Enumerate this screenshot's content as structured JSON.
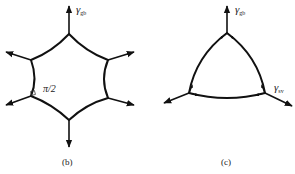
{
  "figures": [
    {
      "id": "b",
      "caption": "(b)",
      "shape": "hexagon-grain-concave-sides",
      "labels": {
        "tension_symbol": "γ",
        "tension_subscript": "gb",
        "angle_label": "π/2"
      }
    },
    {
      "id": "c",
      "caption": "(c)",
      "shape": "triangle-grain-convex-sides",
      "labels": {
        "tension_gb_symbol": "γ",
        "tension_gb_subscript": "gb",
        "tension_sv_symbol": "γ",
        "tension_sv_subscript": "sv"
      }
    }
  ],
  "colors": {
    "stroke": "#111111",
    "text": "#222222",
    "background": "#ffffff"
  }
}
